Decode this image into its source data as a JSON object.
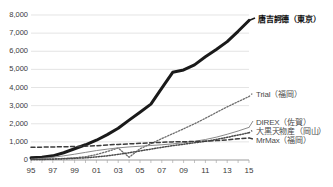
{
  "chart_data": {
    "type": "line",
    "title": "",
    "xlabel": "",
    "ylabel": "",
    "xlim": [
      1995,
      2015
    ],
    "ylim": [
      0,
      8000
    ],
    "grid": true,
    "legend_position": "right-inline",
    "x": [
      1995,
      1996,
      1997,
      1998,
      1999,
      2000,
      2001,
      2002,
      2003,
      2004,
      2005,
      2006,
      2007,
      2008,
      2009,
      2010,
      2011,
      2012,
      2013,
      2014,
      2015
    ],
    "xtick_labels": [
      "95",
      "97",
      "99",
      "01",
      "03",
      "05",
      "07",
      "09",
      "11",
      "13",
      "15"
    ],
    "xtick_values": [
      1995,
      1997,
      1999,
      2001,
      2003,
      2005,
      2007,
      2009,
      2011,
      2013,
      2015
    ],
    "ytick_labels": [
      "0",
      "1,000",
      "2,000",
      "3,000",
      "4,000",
      "5,000",
      "6,000",
      "7,000",
      "8,000"
    ],
    "ytick_values": [
      0,
      1000,
      2000,
      3000,
      4000,
      5000,
      6000,
      7000,
      8000
    ],
    "series": [
      {
        "name": "唐吉訶德（東京）",
        "style": "thick-solid",
        "color": "#1a1a1a",
        "label_anchor_value": 7700,
        "values": [
          120,
          150,
          230,
          400,
          620,
          840,
          1090,
          1400,
          1750,
          2200,
          2630,
          3080,
          3970,
          4840,
          4970,
          5250,
          5700,
          6100,
          6530,
          7100,
          7700
        ]
      },
      {
        "name": "Trial（福岡）",
        "style": "dotted",
        "color": "#6b6b6b",
        "label_anchor_value": 3500,
        "values": [
          30,
          45,
          60,
          85,
          120,
          180,
          300,
          470,
          660,
          150,
          620,
          900,
          1180,
          1450,
          1720,
          2000,
          2300,
          2620,
          2930,
          3220,
          3500
        ]
      },
      {
        "name": "DIREX（佐賀）",
        "style": "thin-solid",
        "color": "#8a8a8a",
        "label_anchor_value": 1800,
        "values": [
          40,
          90,
          150,
          230,
          320,
          420,
          520,
          600,
          670,
          720,
          760,
          800,
          840,
          890,
          950,
          1030,
          1130,
          1260,
          1420,
          1600,
          1800
        ]
      },
      {
        "name": "大黒天物産（岡山）",
        "style": "dotted-dark",
        "color": "#4a4a4a",
        "label_anchor_value": 1500,
        "values": [
          20,
          30,
          45,
          65,
          90,
          120,
          170,
          230,
          310,
          400,
          500,
          600,
          700,
          790,
          870,
          950,
          1030,
          1130,
          1250,
          1380,
          1500
        ]
      },
      {
        "name": "MrMax（福岡）",
        "style": "dashed",
        "color": "#3c3c3c",
        "label_anchor_value": 1220,
        "values": [
          700,
          710,
          720,
          730,
          745,
          760,
          790,
          830,
          860,
          890,
          920,
          950,
          975,
          1000,
          1010,
          1020,
          1040,
          1070,
          1110,
          1170,
          1220
        ]
      }
    ]
  },
  "axis": {
    "ytick_0": "0",
    "ytick_1": "1,000",
    "ytick_2": "2,000",
    "ytick_3": "3,000",
    "ytick_4": "4,000",
    "ytick_5": "5,000",
    "ytick_6": "6,000",
    "ytick_7": "7,000",
    "ytick_8": "8,000",
    "xtick_0": "95",
    "xtick_1": "97",
    "xtick_2": "99",
    "xtick_3": "01",
    "xtick_4": "03",
    "xtick_5": "05",
    "xtick_6": "07",
    "xtick_7": "09",
    "xtick_8": "11",
    "xtick_9": "13",
    "xtick_10": "15"
  },
  "labels": {
    "donki": "唐吉訶德（東京）",
    "trial": "Trial（福岡）",
    "direx": "DIREX（佐賀）",
    "daikokuten": "大黒天物産（岡山）",
    "mrmax": "MrMax（福岡）"
  }
}
